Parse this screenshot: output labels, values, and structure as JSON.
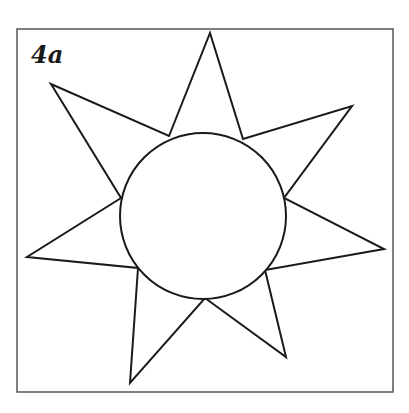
{
  "figure": {
    "label": "4a",
    "stroke_color": "#1a1a1a",
    "frame": {
      "x": 17,
      "y": 29,
      "width": 376,
      "height": 363
    },
    "circle": {
      "cx": 203,
      "cy": 216,
      "r": 83
    },
    "star_polygon": [
      [
        210,
        33
      ],
      [
        243,
        139
      ],
      [
        352,
        106
      ],
      [
        284,
        198
      ],
      [
        384,
        249
      ],
      [
        265,
        270
      ],
      [
        286,
        357
      ],
      [
        205,
        298
      ],
      [
        130,
        383
      ],
      [
        138,
        268
      ],
      [
        27,
        257
      ],
      [
        121,
        198
      ],
      [
        51,
        84
      ],
      [
        169,
        136
      ]
    ]
  }
}
